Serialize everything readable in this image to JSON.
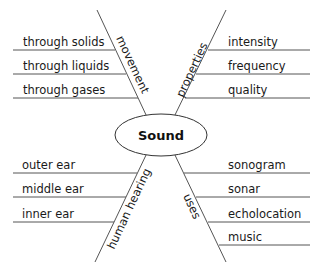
{
  "diagram": {
    "type": "spider-map",
    "center": {
      "label": "Sound"
    },
    "branches": [
      {
        "label": "movement",
        "position": "top-left",
        "details": [
          "through solids",
          "through liquids",
          "through gases"
        ]
      },
      {
        "label": "properties",
        "position": "top-right",
        "details": [
          "intensity",
          "frequency",
          "quality"
        ]
      },
      {
        "label": "human hearing",
        "position": "bottom-left",
        "details": [
          "outer ear",
          "middle ear",
          "inner ear"
        ]
      },
      {
        "label": "uses",
        "position": "bottom-right",
        "details": [
          "sonogram",
          "sonar",
          "echolocation",
          "music"
        ]
      }
    ]
  }
}
